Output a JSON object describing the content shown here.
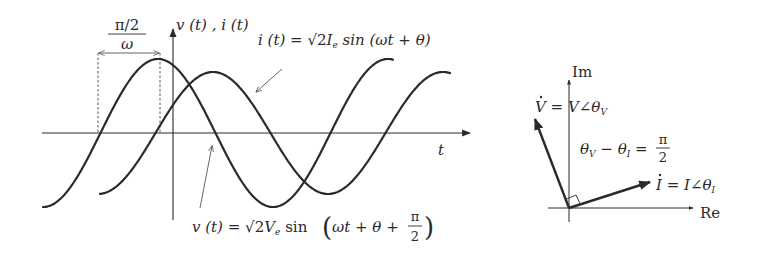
{
  "colors": {
    "background": "#ffffff",
    "stroke": "#2a2a2a",
    "thin": "#555555"
  },
  "waveform": {
    "axis_label_y": "v (t) , i (t)",
    "axis_label_x": "t",
    "phase_shift_label": {
      "numerator": "π/2",
      "denominator": "ω"
    },
    "i_label": {
      "lhs": "i (t) = ",
      "sqrt": "√",
      "coef": "2",
      "var": "I",
      "sub": "e",
      "func": " sin (ωt + θ)"
    },
    "v_label": {
      "lhs": "v (t) = ",
      "sqrt": "√",
      "coef": "2",
      "var": "V",
      "sub": "e",
      "func": " sin",
      "arg": "ωt + θ + ",
      "frac_num": "π",
      "frac_den": "2"
    },
    "v_series": {
      "name": "v(t)",
      "amplitude": 74,
      "peak_x": 158,
      "half_period": 115
    },
    "i_series": {
      "name": "i(t)",
      "amplitude": 61,
      "peak_x": 213,
      "half_period": 115
    }
  },
  "phasor": {
    "im_label": "Im",
    "re_label": "Re",
    "v_label": {
      "lhs": "V",
      "dot": "˙",
      "rhs": " = V∠θ",
      "sub": "V"
    },
    "i_label": {
      "lhs": "I",
      "dot": "˙",
      "rhs": " = I∠θ",
      "sub": "I"
    },
    "diff_label": {
      "a": "θ",
      "a_sub": "V",
      "minus": " − θ",
      "b_sub": "I",
      "eq": " = ",
      "num": "π",
      "den": "2"
    }
  }
}
